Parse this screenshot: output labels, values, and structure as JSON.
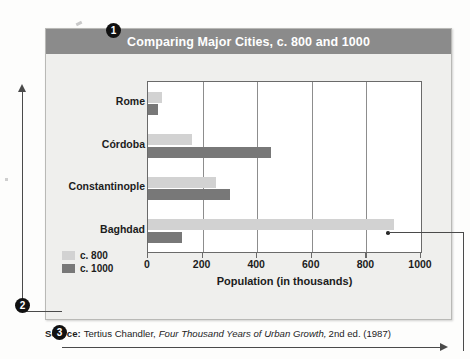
{
  "figure": {
    "title": "Comparing Major Cities, c. 800 and 1000",
    "x_axis_title": "Population (in thousands)",
    "callout_badges": {
      "badge_1": "1",
      "badge_2": "2",
      "badge_3": "3"
    }
  },
  "source": {
    "label": "Source:",
    "author": "Tertius Chandler,",
    "work_title": "Four Thousand Years of Urban Growth,",
    "edition": "2nd ed. (1987)"
  },
  "legend": {
    "items": [
      {
        "label": "c. 800",
        "color": "#d2d2d2"
      },
      {
        "label": "c. 1000",
        "color": "#787878"
      }
    ]
  },
  "chart_data": {
    "type": "bar",
    "orientation": "horizontal",
    "title": "Comparing Major Cities, c. 800 and 1000",
    "xlabel": "Population (in thousands)",
    "ylabel": "",
    "xlim": [
      0,
      1000
    ],
    "xticks": [
      0,
      200,
      400,
      600,
      800,
      1000
    ],
    "xtick_labels": [
      "0",
      "200",
      "400",
      "600",
      "800",
      "1000"
    ],
    "grid": true,
    "legend_position": "bottom-left",
    "categories": [
      "Rome",
      "Córdoba",
      "Constantinople",
      "Baghdad"
    ],
    "series": [
      {
        "name": "c. 800",
        "color": "#d2d2d2",
        "values": [
          50,
          160,
          250,
          900
        ]
      },
      {
        "name": "c. 1000",
        "color": "#787878",
        "values": [
          35,
          450,
          300,
          125
        ]
      }
    ]
  }
}
